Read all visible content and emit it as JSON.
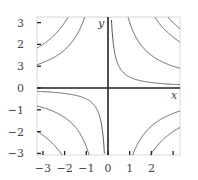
{
  "chart_data": {
    "type": "line",
    "title": "",
    "xlabel": "x",
    "ylabel": "y",
    "xlim": [
      -3.3,
      3.3
    ],
    "ylim": [
      -3.1,
      3.2
    ],
    "grid": false,
    "x_ticks": [
      -3,
      -2,
      -1,
      0,
      1,
      2,
      3
    ],
    "x_tick_labels": [
      "−3",
      "−2",
      "−1",
      "0",
      "1",
      "2",
      ""
    ],
    "y_ticks": [
      3,
      2,
      1,
      0,
      -1,
      -2,
      -3
    ],
    "y_tick_labels": [
      "3",
      "2",
      "3",
      "0",
      "−1",
      "−2",
      "−3"
    ],
    "series": [
      {
        "name": "xy=0.5 (Q1)",
        "c": 0.5,
        "branch": "positive-x"
      },
      {
        "name": "xy=3 (Q1)",
        "c": 3,
        "branch": "positive-x"
      },
      {
        "name": "xy=7 (Q1)",
        "c": 7,
        "branch": "positive-x"
      },
      {
        "name": "xy=9 (Q1)",
        "c": 9,
        "branch": "positive-x"
      },
      {
        "name": "xy=0.5 (Q3)",
        "c": 0.5,
        "branch": "negative-x"
      },
      {
        "name": "xy=2.7 (Q3)",
        "c": 2.7,
        "branch": "negative-x"
      },
      {
        "name": "xy=6.5 (Q3)",
        "c": 6.5,
        "branch": "negative-x"
      },
      {
        "name": "xy=-3.5 (Q2)",
        "c": -3.5,
        "branch": "negative-x"
      },
      {
        "name": "xy=-6 (Q2)",
        "c": -6,
        "branch": "negative-x"
      },
      {
        "name": "xy=-3.5 (Q4)",
        "c": -3.5,
        "branch": "positive-x"
      },
      {
        "name": "xy=-6 (Q4)",
        "c": -6,
        "branch": "positive-x"
      }
    ]
  },
  "labels": {
    "x_axis": "x",
    "y_axis": "y"
  },
  "colors": {
    "curve": "#555555",
    "axis": "#222222",
    "frame": "#d8d8d8",
    "tick": "#222222",
    "text": "#444444"
  }
}
